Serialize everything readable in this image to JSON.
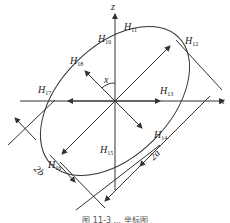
{
  "axes": {
    "x_label": "x",
    "z_label": "z",
    "angle_label": "x"
  },
  "dimensions": {
    "major": "2a",
    "minor": "2b"
  },
  "points": {
    "h10": {
      "base": "H",
      "sub": "10"
    },
    "h11": {
      "base": "H",
      "sub": "11"
    },
    "h12": {
      "base": "H",
      "sub": "12"
    },
    "h13": {
      "base": "H",
      "sub": "13"
    },
    "h14": {
      "base": "H",
      "sub": "14"
    },
    "h15": {
      "base": "H",
      "sub": "15"
    },
    "h16": {
      "base": "H",
      "sub": "16"
    },
    "h17": {
      "base": "H",
      "sub": "17"
    },
    "h18": {
      "base": "H",
      "sub": "18"
    }
  },
  "caption": "图 11-3 ... 坐标图",
  "colors": {
    "stroke": "#333333"
  }
}
